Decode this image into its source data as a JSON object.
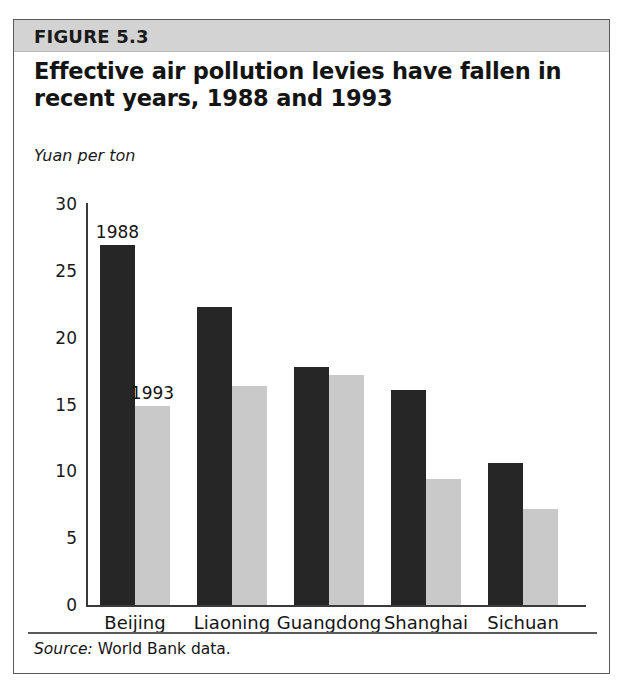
{
  "figure": {
    "number_label": "FIGURE 5.3",
    "title": "Effective air pollution levies have fallen in recent years, 1988 and 1993",
    "source_label": "Source:",
    "source_text": "World Bank data."
  },
  "colors": {
    "series_1988": "#262626",
    "series_1993": "#c9c9c9",
    "header_band": "#d3d3d3",
    "frame_border": "#5a5a5a",
    "axis": "#3a3a3a"
  },
  "chart_data": {
    "type": "bar",
    "title": "Effective air pollution levies have fallen in recent years, 1988 and 1993",
    "xlabel": "",
    "ylabel": "Yuan per ton",
    "ylim": [
      0,
      30
    ],
    "yticks": [
      0,
      5,
      10,
      15,
      20,
      25,
      30
    ],
    "grid": false,
    "legend": "inline annotations on first group",
    "categories": [
      "Beijing",
      "Liaoning",
      "Guangdong",
      "Shanghai",
      "Sichuan"
    ],
    "series": [
      {
        "name": "1988",
        "values": [
          26.9,
          22.3,
          17.8,
          16.1,
          10.6
        ]
      },
      {
        "name": "1993",
        "values": [
          14.9,
          16.4,
          17.2,
          9.4,
          7.2
        ]
      }
    ],
    "annotations": [
      {
        "text": "1988",
        "series": "1988",
        "category": "Beijing"
      },
      {
        "text": "1993",
        "series": "1993",
        "category": "Beijing"
      }
    ]
  }
}
